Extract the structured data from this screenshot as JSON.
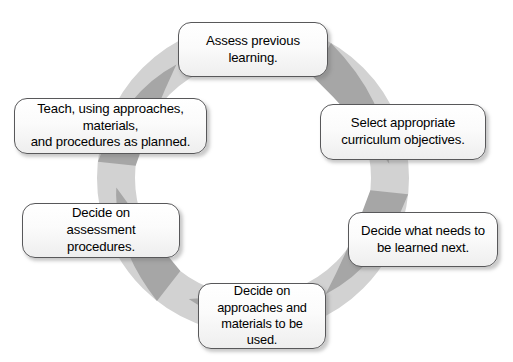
{
  "diagram": {
    "type": "cycle",
    "direction": "clockwise",
    "colors": {
      "ring": "#d2d2d2",
      "arrow": "#a6a6a6",
      "box_border": "#58585a",
      "box_fill": "#fbfbfb",
      "text": "#000000",
      "background": "#ffffff"
    },
    "geometry": {
      "center_x": 253,
      "center_y": 178,
      "outer_radius": 156,
      "inner_radius": 118
    },
    "nodes": [
      {
        "id": "assess",
        "order": 1,
        "label": "Assess previous learning.",
        "lines": [
          "Assess previous",
          "learning."
        ],
        "position": "top"
      },
      {
        "id": "select",
        "order": 2,
        "label": "Select appropriate curriculum objectives.",
        "lines": [
          "Select appropriate",
          "curriculum objectives."
        ],
        "position": "upper-right"
      },
      {
        "id": "decide-next",
        "order": 3,
        "label": "Decide what needs to be learned next.",
        "lines": [
          "Decide what needs to",
          "be learned next."
        ],
        "position": "lower-right"
      },
      {
        "id": "decide-approaches",
        "order": 4,
        "label": "Decide on approaches and materials to be used.",
        "lines": [
          "Decide on",
          "approaches and",
          "materials to be used."
        ],
        "position": "bottom"
      },
      {
        "id": "decide-assessment",
        "order": 5,
        "label": "Decide on assessment procedures.",
        "lines": [
          "Decide on",
          "assessment procedures."
        ],
        "position": "lower-left"
      },
      {
        "id": "teach",
        "order": 6,
        "label": "Teach, using approaches, materials, and procedures as planned.",
        "lines": [
          "Teach, using approaches, materials,",
          "and procedures as planned."
        ],
        "position": "upper-left"
      }
    ],
    "arrows": [
      {
        "id": "arrow-assess-to-select",
        "from": "assess",
        "to": "select",
        "angle_start_deg": -60,
        "angle_end_deg": -6
      },
      {
        "id": "arrow-select-to-next",
        "from": "select",
        "to": "decide-next",
        "angle_start_deg": 6,
        "angle_end_deg": 58
      },
      {
        "id": "arrow-next-to-approaches",
        "from": "decide-next",
        "to": "decide-approaches",
        "angle_start_deg": 68,
        "angle_end_deg": 118
      },
      {
        "id": "arrow-approaches-to-assessment",
        "from": "decide-approaches",
        "to": "decide-assessment",
        "angle_start_deg": 128,
        "angle_end_deg": 176
      },
      {
        "id": "arrow-assessment-to-teach",
        "from": "decide-assessment",
        "to": "teach",
        "angle_start_deg": 186,
        "angle_end_deg": 236
      },
      {
        "id": "arrow-teach-to-assess",
        "from": "teach",
        "to": "assess",
        "angle_start_deg": 248,
        "angle_end_deg": 298
      }
    ]
  }
}
